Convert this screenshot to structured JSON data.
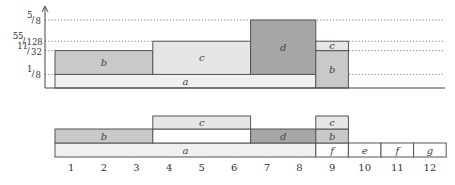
{
  "colors": {
    "a": "#f0f0f0",
    "b": "#c9c9c9",
    "c": "#e6e6e6",
    "d": "#a6a6a6",
    "white": "#ffffff",
    "stroke": "#555555"
  },
  "top_chart": {
    "y_ticks": [
      {
        "label": "1/8",
        "num": "1",
        "den": "8",
        "value": 0.125
      },
      {
        "label": "11/32",
        "num": "11",
        "den": "32",
        "value": 0.34375
      },
      {
        "label": "55/128",
        "num": "55",
        "den": "128",
        "value": 0.4296875
      },
      {
        "label": "5/8",
        "num": "5",
        "den": "8",
        "value": 0.625
      }
    ],
    "blocks": [
      {
        "label": "a",
        "x0": 1,
        "x1": 9,
        "y0": 0,
        "y1": 0.125,
        "fill": "a"
      },
      {
        "label": "b",
        "x0": 1,
        "x1": 4,
        "y0": 0.125,
        "y1": 0.34375,
        "fill": "b"
      },
      {
        "label": "c",
        "x0": 4,
        "x1": 7,
        "y0": 0.125,
        "y1": 0.4296875,
        "fill": "c"
      },
      {
        "label": "d",
        "x0": 7,
        "x1": 9,
        "y0": 0.125,
        "y1": 0.625,
        "fill": "d"
      },
      {
        "label": "b",
        "x0": 9,
        "x1": 10,
        "y0": 0,
        "y1": 0.34375,
        "fill": "b"
      },
      {
        "label": "c",
        "x0": 9,
        "x1": 10,
        "y0": 0.34375,
        "y1": 0.4296875,
        "fill": "c"
      }
    ]
  },
  "bottom_chart": {
    "rows": [
      {
        "row": 0,
        "cells": [
          {
            "label": "a",
            "x0": 1,
            "x1": 9,
            "fill": "a"
          },
          {
            "label": "f",
            "x0": 9,
            "x1": 10,
            "fill": "white"
          },
          {
            "label": "e",
            "x0": 10,
            "x1": 11,
            "fill": "white"
          },
          {
            "label": "f",
            "x0": 11,
            "x1": 12,
            "fill": "white"
          },
          {
            "label": "g",
            "x0": 12,
            "x1": 13,
            "fill": "white"
          }
        ]
      },
      {
        "row": 1,
        "cells": [
          {
            "label": "b",
            "x0": 1,
            "x1": 4,
            "fill": "b"
          },
          {
            "label": "",
            "x0": 4,
            "x1": 7,
            "fill": "white"
          },
          {
            "label": "d",
            "x0": 7,
            "x1": 9,
            "fill": "d"
          },
          {
            "label": "b",
            "x0": 9,
            "x1": 10,
            "fill": "b"
          }
        ]
      },
      {
        "row": 2,
        "cells": [
          {
            "label": "c",
            "x0": 4,
            "x1": 7,
            "fill": "c"
          },
          {
            "label": "c",
            "x0": 9,
            "x1": 10,
            "fill": "c"
          }
        ]
      }
    ],
    "x_ticks": [
      "1",
      "2",
      "3",
      "4",
      "5",
      "6",
      "7",
      "8",
      "9",
      "10",
      "11",
      "12"
    ]
  }
}
